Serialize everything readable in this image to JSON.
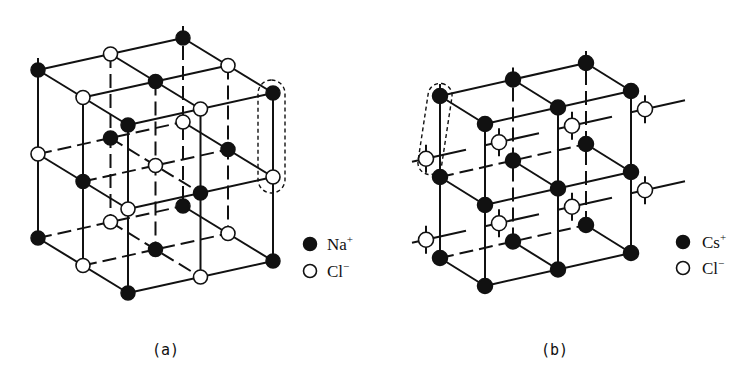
{
  "figure": {
    "panels": [
      {
        "id": "a",
        "label": "(a)",
        "structure": "rock-salt (NaCl) lattice, 3×3×3 ions, alternating",
        "legend": [
          {
            "symbol": "filled-circle",
            "ion": "Na",
            "charge": "+"
          },
          {
            "symbol": "open-circle",
            "ion": "Cl",
            "charge": "−"
          }
        ],
        "highlight": "dashed capsule around one vertical Na–Cl pair at right edge"
      },
      {
        "id": "b",
        "label": "(b)",
        "structure": "CsCl lattice, 3×2×3 Cs+ corners with Cl− at cube centers",
        "legend": [
          {
            "symbol": "filled-circle",
            "ion": "Cs",
            "charge": "+"
          },
          {
            "symbol": "open-circle",
            "ion": "Cl",
            "charge": "−"
          }
        ],
        "highlight": "dashed slanted capsule around Cs+ corner and adjacent Cl− center"
      }
    ]
  },
  "colors": {
    "ink": "#111111",
    "background": "#ffffff",
    "anion_fill": "#ffffff"
  }
}
